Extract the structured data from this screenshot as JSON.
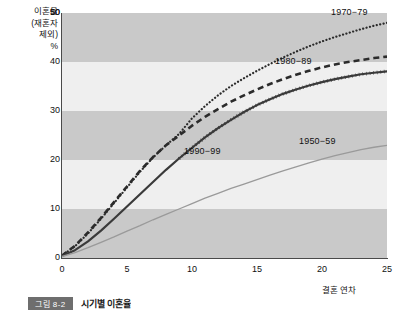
{
  "chart_data": {
    "type": "line",
    "title": "시기별 이혼율",
    "figure_number": "그림 8-2",
    "xlabel": "결혼 연차",
    "ylabel": "이혼율 (재혼자 제외) %",
    "ylabel_lines": [
      "이혼율",
      "(재혼자",
      "제외)",
      "%"
    ],
    "xlim": [
      0,
      25
    ],
    "ylim": [
      0,
      50
    ],
    "xticks": [
      0,
      5,
      10,
      15,
      20,
      25
    ],
    "yticks": [
      0,
      10,
      20,
      30,
      40,
      50
    ],
    "stray_top_tick": "50",
    "grid": "horizontal-bands",
    "legend_position": "inline-annotations",
    "band_colors": [
      "#efefef",
      "#c9c9c9"
    ],
    "series": [
      {
        "name": "1970-79",
        "style": "dotted",
        "color": "#2b2b2b",
        "label_x": 25,
        "x": [
          0,
          1,
          2,
          3,
          4,
          5,
          6,
          7,
          8,
          9,
          10,
          11,
          12,
          13,
          14,
          15,
          16,
          17,
          18,
          19,
          20,
          21,
          22,
          23,
          24,
          25
        ],
        "y": [
          0.5,
          2.4,
          5.0,
          8.0,
          11.2,
          14.4,
          17.6,
          20.5,
          23.0,
          25.3,
          28.5,
          31.0,
          33.2,
          35.1,
          36.7,
          38.2,
          39.6,
          40.9,
          42.1,
          43.2,
          44.2,
          45.1,
          45.9,
          46.7,
          47.4,
          48.0
        ]
      },
      {
        "name": "1980-89",
        "style": "dashed",
        "color": "#2b2b2b",
        "label_x": 19,
        "x": [
          0,
          1,
          2,
          3,
          4,
          5,
          6,
          7,
          8,
          9,
          10,
          11,
          12,
          13,
          14,
          15,
          16,
          17,
          18,
          19,
          20,
          21,
          22,
          23,
          24,
          25
        ],
        "y": [
          0.5,
          2.5,
          5.2,
          8.2,
          11.4,
          14.6,
          17.8,
          20.6,
          23.0,
          25.0,
          27.0,
          28.8,
          30.4,
          31.9,
          33.2,
          34.4,
          35.5,
          36.5,
          37.4,
          38.2,
          38.9,
          39.5,
          40.0,
          40.4,
          40.8,
          41.1
        ]
      },
      {
        "name": "1990-99",
        "style": "solid-thick",
        "color": "#3a3a3a",
        "label_x": 10,
        "x": [
          0,
          1,
          2,
          3,
          4,
          5,
          6,
          7,
          8,
          9,
          10,
          11,
          12,
          13,
          14,
          15,
          16,
          17,
          18,
          19,
          20,
          21,
          22,
          23,
          24,
          25
        ],
        "y": [
          0.4,
          1.6,
          3.4,
          5.6,
          8.0,
          10.5,
          13.0,
          15.5,
          18.0,
          20.3,
          22.5,
          24.6,
          26.5,
          28.2,
          29.8,
          31.2,
          32.4,
          33.5,
          34.4,
          35.2,
          35.9,
          36.5,
          37.0,
          37.5,
          37.8,
          38.1
        ]
      },
      {
        "name": "1950-59",
        "style": "solid-thin",
        "color": "#9a9a9a",
        "label_x": 21,
        "x": [
          0,
          1,
          2,
          3,
          4,
          5,
          6,
          7,
          8,
          9,
          10,
          11,
          12,
          13,
          14,
          15,
          16,
          17,
          18,
          19,
          20,
          21,
          22,
          23,
          24,
          25
        ],
        "y": [
          0.3,
          1.1,
          2.1,
          3.2,
          4.3,
          5.5,
          6.6,
          7.8,
          8.9,
          10.0,
          11.1,
          12.2,
          13.2,
          14.2,
          15.1,
          16.0,
          16.9,
          17.8,
          18.6,
          19.4,
          20.2,
          20.9,
          21.5,
          22.1,
          22.6,
          23.0
        ]
      }
    ]
  }
}
